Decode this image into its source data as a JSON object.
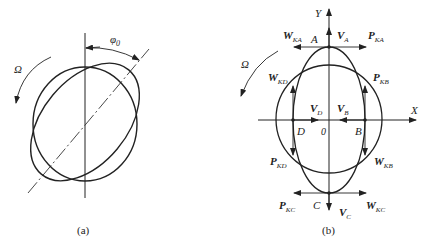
{
  "panel_a": {
    "caption": "(a)",
    "rotation_label": "Ω",
    "angle_label": "φ",
    "angle_subscript": "0"
  },
  "panel_b": {
    "caption": "(b)",
    "rotation_label": "Ω",
    "axes": {
      "x": "X",
      "y": "Y",
      "origin": "0"
    },
    "points": {
      "A": "A",
      "B": "B",
      "C": "C",
      "D": "D"
    },
    "vectors": {
      "VA": {
        "main": "V",
        "sub": "A"
      },
      "VB": {
        "main": "V",
        "sub": "B"
      },
      "VC": {
        "main": "V",
        "sub": "C"
      },
      "VD": {
        "main": "V",
        "sub": "D"
      },
      "WKA": {
        "main": "W",
        "sub": "KA"
      },
      "PKA": {
        "main": "P",
        "sub": "KA"
      },
      "WKD": {
        "main": "W",
        "sub": "KD"
      },
      "PKB": {
        "main": "P",
        "sub": "KB"
      },
      "PKD": {
        "main": "P",
        "sub": "KD"
      },
      "WKB": {
        "main": "W",
        "sub": "KB"
      },
      "PKC": {
        "main": "P",
        "sub": "KC"
      },
      "WKC": {
        "main": "W",
        "sub": "KC"
      }
    }
  }
}
